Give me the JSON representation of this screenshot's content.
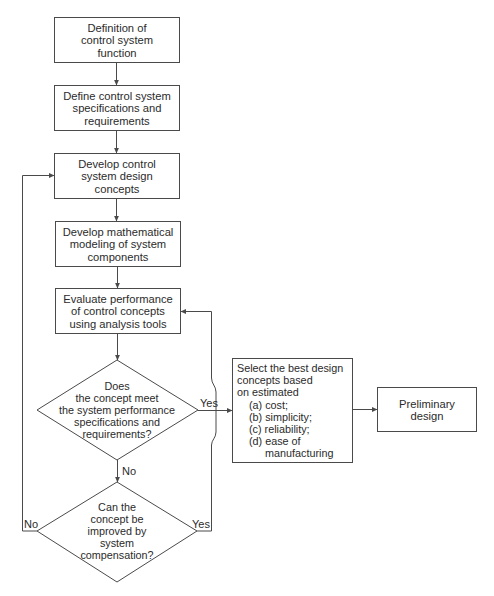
{
  "diagram": {
    "type": "flowchart",
    "nodes": {
      "n1": {
        "lines": [
          "Definition of",
          "control system",
          "function"
        ]
      },
      "n2": {
        "lines": [
          "Define control system",
          "specifications and",
          "requirements"
        ]
      },
      "n3": {
        "lines": [
          "Develop control",
          "system design",
          "concepts"
        ]
      },
      "n4": {
        "lines": [
          "Develop mathematical",
          "modeling of system",
          "components"
        ]
      },
      "n5": {
        "lines": [
          "Evaluate performance",
          "of control concepts",
          "using analysis tools"
        ]
      },
      "d1": {
        "lines": [
          "Does",
          "the concept meet",
          "the system performance",
          "specifications and",
          "requirements?"
        ]
      },
      "d2": {
        "lines": [
          "Can the",
          "concept be",
          "improved by",
          "system",
          "compensation?"
        ]
      },
      "n6": {
        "lines": [
          "Select the best design",
          "concepts based",
          "on estimated"
        ],
        "items": [
          "(a) cost;",
          "(b) simplicity;",
          "(c) reliability;",
          "(d) ease of"
        ],
        "item_continuation": "manufacturing"
      },
      "n7": {
        "lines": [
          "Preliminary",
          "design"
        ]
      }
    },
    "edge_labels": {
      "d1_yes": "Yes",
      "d1_no": "No",
      "d2_no": "No",
      "d2_yes": "Yes"
    },
    "edges": [
      {
        "from": "n1",
        "to": "n2"
      },
      {
        "from": "n2",
        "to": "n3"
      },
      {
        "from": "n3",
        "to": "n4"
      },
      {
        "from": "n4",
        "to": "n5"
      },
      {
        "from": "n5",
        "to": "d1"
      },
      {
        "from": "d1",
        "to": "n6",
        "label": "Yes"
      },
      {
        "from": "d1",
        "to": "d2",
        "label": "No"
      },
      {
        "from": "d2",
        "to": "n3",
        "label": "No"
      },
      {
        "from": "d2",
        "to": "n5",
        "label": "Yes"
      },
      {
        "from": "n6",
        "to": "n7"
      }
    ],
    "colors": {
      "stroke": "#4a4a4a",
      "text": "#2b2b2b",
      "background": "#ffffff"
    }
  }
}
